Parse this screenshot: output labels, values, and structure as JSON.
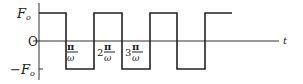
{
  "diagram": {
    "type": "square-wave",
    "y_labels": {
      "top": "F",
      "top_sub": "o",
      "zero": "O",
      "bottom": "−F",
      "bottom_sub": "o"
    },
    "x_axis_label": "t",
    "x_tick_labels": [
      {
        "coef": "",
        "num": "π",
        "den": "ω"
      },
      {
        "coef": "2",
        "num": "π",
        "den": "ω"
      },
      {
        "coef": "3",
        "num": "π",
        "den": "ω"
      }
    ],
    "line_color": "#222222"
  }
}
